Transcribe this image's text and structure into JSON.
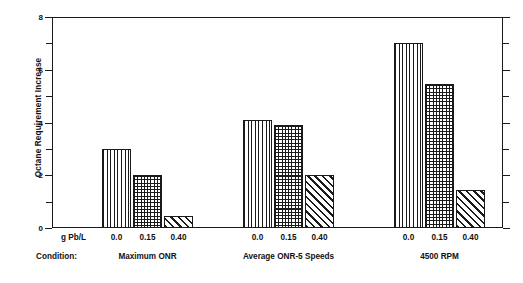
{
  "chart_data": {
    "type": "bar",
    "title": "",
    "xlabel": "",
    "ylabel": "Octane Requirement Increase",
    "ylim": [
      0,
      8
    ],
    "y_major_ticks": [
      0,
      2,
      4,
      6,
      8
    ],
    "y_minor_ticks": [
      1,
      3,
      5,
      7
    ],
    "y_tick_labels": [
      "0",
      "2",
      "4",
      "6",
      "8"
    ],
    "grid": false,
    "legend": "none",
    "group_axis_label": "Condition:",
    "series_axis_label": "g Pb/L",
    "categories": [
      "0.0",
      "0.15",
      "0.40"
    ],
    "groups": [
      {
        "name": "Maximum ONR",
        "values": [
          3.0,
          2.0,
          0.45
        ],
        "patterns": [
          "vertical-lines",
          "cross-hatch",
          "diagonal-hatch"
        ]
      },
      {
        "name": "Average ONR-5 Speeds",
        "values": [
          4.1,
          3.9,
          2.0
        ],
        "patterns": [
          "vertical-lines",
          "cross-hatch",
          "diagonal-hatch"
        ]
      },
      {
        "name": "4500 RPM",
        "values": [
          7.0,
          5.45,
          1.45
        ],
        "patterns": [
          "vertical-lines",
          "cross-hatch",
          "diagonal-hatch"
        ]
      }
    ],
    "colors": {
      "axis": "#1a1a1a",
      "bar_outline": "#1a1a1a",
      "bar_fill": "#ffffff",
      "background": "#ffffff"
    }
  },
  "layout": {
    "group_centers_px": [
      147.5,
      288.5,
      439.5
    ],
    "bar_width_px": 29,
    "bar_gap_px": 2
  }
}
